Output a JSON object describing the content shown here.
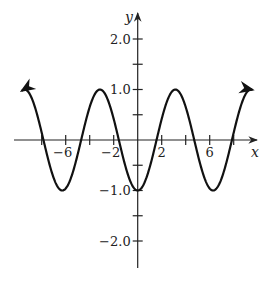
{
  "chart_data": {
    "type": "line",
    "title": "",
    "function": "y = -cos(x)",
    "xlabel": "x",
    "ylabel": "y",
    "xlim": [
      -10.3,
      10.2
    ],
    "ylim": [
      -2.55,
      2.6
    ],
    "x_ticks": [
      -8,
      -6,
      -4,
      -2,
      2,
      4,
      6,
      8
    ],
    "x_tick_labels": [
      {
        "value": -6,
        "label": "−6"
      },
      {
        "value": -2,
        "label": "−2"
      },
      {
        "value": 2,
        "label": "2"
      },
      {
        "value": 6,
        "label": "6"
      }
    ],
    "y_ticks": [
      -2.0,
      -1.5,
      -1.0,
      -0.5,
      0.5,
      1.0,
      1.5,
      2.0
    ],
    "y_tick_labels": [
      {
        "value": 2.0,
        "label": "2.0"
      },
      {
        "value": 1.0,
        "label": "1.0"
      },
      {
        "value": -1.0,
        "label": "−1.0"
      },
      {
        "value": -2.0,
        "label": "−2.0"
      }
    ],
    "series": [
      {
        "name": "-cos(x)",
        "x_range": [
          -9.6,
          9.5
        ],
        "key_points": [
          {
            "x": -9.42,
            "y": 1.0
          },
          {
            "x": -7.85,
            "y": 0
          },
          {
            "x": -6.28,
            "y": -1.0
          },
          {
            "x": -4.71,
            "y": 0
          },
          {
            "x": -3.14,
            "y": 1.0
          },
          {
            "x": -1.57,
            "y": 0
          },
          {
            "x": 0,
            "y": -1.0
          },
          {
            "x": 1.57,
            "y": 0
          },
          {
            "x": 3.14,
            "y": 1.0
          },
          {
            "x": 4.71,
            "y": 0
          },
          {
            "x": 6.28,
            "y": -1.0
          },
          {
            "x": 7.85,
            "y": 0
          },
          {
            "x": 9.42,
            "y": 1.0
          }
        ],
        "arrows_at_ends": true
      }
    ],
    "grid": false,
    "legend": null
  },
  "colors": {
    "curve": "#111111",
    "axes": "#222222",
    "background": "#ffffff"
  }
}
